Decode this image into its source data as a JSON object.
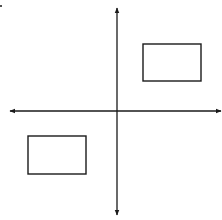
{
  "diagram": {
    "type": "coordinate-plane",
    "background": "#ffffff",
    "stroke_color": "#1a1a1a",
    "axes": {
      "x_axis": {
        "y": 111,
        "x_start": 10,
        "x_end": 221,
        "arrows": "both"
      },
      "y_axis": {
        "x": 117,
        "y_start": 8,
        "y_end": 215,
        "arrows": "both"
      }
    },
    "shapes": [
      {
        "name": "rectangle-quadrant-1",
        "quadrant": "I",
        "x": 143,
        "y": 44,
        "width": 58,
        "height": 37
      },
      {
        "name": "rectangle-quadrant-3",
        "quadrant": "III",
        "x": 28,
        "y": 136,
        "width": 58,
        "height": 38
      }
    ],
    "corner_mark": {
      "x": 1,
      "y": 6,
      "r": 1
    }
  }
}
